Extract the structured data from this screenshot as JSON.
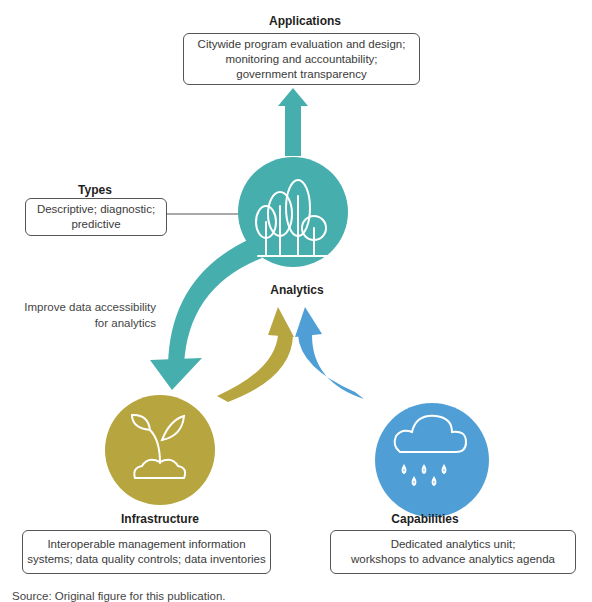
{
  "colors": {
    "teal": "#47aeae",
    "olive": "#b7a53f",
    "blue": "#4f9fd6",
    "border": "#555555",
    "text": "#3a3a3a"
  },
  "applications": {
    "heading": "Applications",
    "lines": [
      "Citywide program evaluation and design;",
      "monitoring and accountability;",
      "government transparency"
    ]
  },
  "types": {
    "heading": "Types",
    "lines": [
      "Descriptive; diagnostic;",
      "predictive"
    ]
  },
  "analytics": {
    "label": "Analytics",
    "icon": "trees-icon"
  },
  "arrow_note": {
    "lines": [
      "Improve data accessibility",
      "for analytics"
    ]
  },
  "infrastructure": {
    "heading": "Infrastructure",
    "icon": "sprout-icon",
    "lines": [
      "Interoperable management information",
      "systems; data quality controls; data inventories"
    ]
  },
  "capabilities": {
    "heading": "Capabilities",
    "icon": "rain-cloud-icon",
    "lines": [
      "Dedicated analytics unit;",
      "workshops to advance analytics agenda"
    ]
  },
  "source": "Source: Original figure for this publication."
}
